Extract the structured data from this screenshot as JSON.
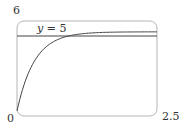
{
  "chart_data": {
    "type": "line",
    "title": "",
    "xlabel": "",
    "ylabel": "",
    "xlim": [
      0,
      2.5
    ],
    "ylim": [
      0,
      6
    ],
    "grid": false,
    "tick_labels": {
      "y_top": "6",
      "origin": "0",
      "x_right": "2.5"
    },
    "series": [
      {
        "name": "curve",
        "function": "y = 5(1 - e^(-3.2x))",
        "x": [
          0,
          0.25,
          0.5,
          0.75,
          1.0,
          1.25,
          1.5,
          2.0,
          2.5
        ],
        "values": [
          0,
          2.75,
          4.0,
          4.55,
          4.8,
          4.91,
          4.96,
          4.99,
          5.0
        ]
      },
      {
        "name": "asymptote",
        "function": "y = 5",
        "x": [
          0,
          2.5
        ],
        "values": [
          5,
          5
        ]
      }
    ],
    "annotations": [
      {
        "text": "y = 5",
        "x": 0.55,
        "y": 5.4
      }
    ]
  },
  "labels": {
    "y_top": "6",
    "origin": "0",
    "x_right": "2.5",
    "asymptote": "y = 5"
  }
}
